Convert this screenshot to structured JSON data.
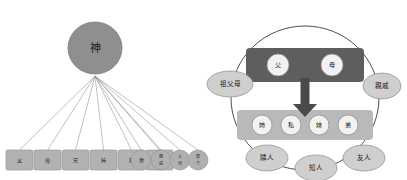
{
  "figure": {
    "background": "#ffffff",
    "width": 407,
    "height": 180
  },
  "colors": {
    "deity_fill": "#8f8f8f",
    "deity_stroke": "#7b7b7b",
    "box_fill": "#b2b2b2",
    "box_stroke": "#9a9a9a",
    "circle_fill": "#b0b0b0",
    "circle_stroke": "#989898",
    "ray_stroke": "#8c8c8c",
    "ring_stroke": "#3a3a3a",
    "parent_band_fill": "#5e5e5e",
    "sibling_band_fill": "#b9b9b9",
    "chip_fill": "#f2f2f2",
    "chip_stroke": "#8a8a8a",
    "pill_fill": "#cfcfcf",
    "pill_stroke": "#8a8a8a",
    "arrow_fill": "#4a4a4a",
    "text": "#1c1c1c"
  },
  "left_diagram": {
    "name": "god-centered-relations",
    "center_node": {
      "label": "神",
      "cx": 95,
      "cy": 48,
      "rx": 27,
      "ry": 26
    },
    "ray_origin": {
      "x": 95,
      "y": 76
    },
    "boxes": [
      {
        "label": "父",
        "x": 6,
        "y": 150,
        "w": 27,
        "h": 20
      },
      {
        "label": "母",
        "x": 34,
        "y": 150,
        "w": 27,
        "h": 20
      },
      {
        "label": "兄",
        "x": 62,
        "y": 150,
        "w": 27,
        "h": 20
      },
      {
        "label": "姉",
        "x": 90,
        "y": 150,
        "w": 27,
        "h": 20
      },
      {
        "label": "私",
        "x": 118,
        "y": 150,
        "w": 27,
        "h": 20
      },
      {
        "label": "妹",
        "x": 146,
        "y": 150,
        "w": 27,
        "h": 20
      }
    ],
    "circles": [
      {
        "label": "妻",
        "cx": 141,
        "cy": 160,
        "rx": 10,
        "ry": 10,
        "stacked": false
      },
      {
        "label": "親戚",
        "cx": 161,
        "cy": 160,
        "rx": 10,
        "ry": 10,
        "stacked": true
      },
      {
        "label": "上司",
        "cx": 180,
        "cy": 160,
        "rx": 10,
        "ry": 10,
        "stacked": true
      },
      {
        "label": "部下",
        "cx": 198,
        "cy": 160,
        "rx": 10,
        "ry": 10,
        "stacked": true
      }
    ]
  },
  "right_diagram": {
    "name": "self-centered-relations",
    "ring": {
      "cx": 101,
      "cy": 98,
      "rx": 74,
      "ry": 72
    },
    "parent_band": {
      "name": "parents-band",
      "x": 42,
      "y": 48,
      "w": 118,
      "h": 34,
      "chips": [
        {
          "label": "父",
          "cx": 74,
          "cy": 65,
          "r": 11
        },
        {
          "label": "母",
          "cx": 128,
          "cy": 65,
          "r": 11
        }
      ]
    },
    "arrow": {
      "name": "descent-arrow",
      "x_center": 101,
      "shaft_top": 78,
      "shaft_bottom": 104,
      "shaft_width": 9,
      "head_width": 24,
      "head_bottom": 117
    },
    "sibling_band": {
      "name": "siblings-band",
      "x": 33,
      "y": 110,
      "w": 136,
      "h": 30,
      "chips": [
        {
          "label": "姉",
          "cx": 58,
          "cy": 125,
          "r": 10
        },
        {
          "label": "私",
          "cx": 87,
          "cy": 125,
          "r": 10
        },
        {
          "label": "妹",
          "cx": 115,
          "cy": 125,
          "r": 10
        },
        {
          "label": "弟",
          "cx": 144,
          "cy": 125,
          "r": 10
        }
      ]
    },
    "pills": [
      {
        "name": "pill-grandparents",
        "label": "祖父母",
        "cx": 26,
        "cy": 84,
        "rx": 23,
        "ry": 13
      },
      {
        "name": "pill-relatives",
        "label": "親戚",
        "cx": 178,
        "cy": 86,
        "rx": 19,
        "ry": 13
      },
      {
        "name": "pill-neighbor",
        "label": "隣人",
        "cx": 63,
        "cy": 158,
        "rx": 21,
        "ry": 13
      },
      {
        "name": "pill-acquaintance",
        "label": "知人",
        "cx": 112,
        "cy": 168,
        "rx": 21,
        "ry": 13
      },
      {
        "name": "pill-friend",
        "label": "友人",
        "cx": 160,
        "cy": 158,
        "rx": 21,
        "ry": 13
      }
    ]
  }
}
